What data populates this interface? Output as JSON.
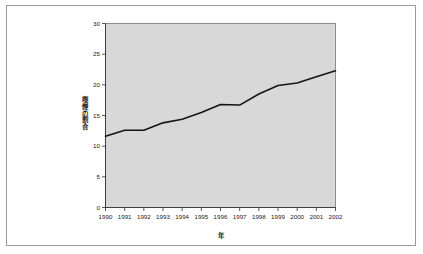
{
  "figure": {
    "frame_border_color": "#9a9a9a",
    "background_color": "#ffffff",
    "plot_background_color": "#d8d8d8",
    "plot_border_color": "#8c8c8c",
    "line_color": "#151515"
  },
  "chart_data": {
    "type": "line",
    "title": "",
    "subtitle": "",
    "xlabel": "年",
    "ylabel": "喫煙の割合",
    "xlim": [
      1990,
      2002
    ],
    "ylim": [
      0,
      30
    ],
    "grid": false,
    "legend": "none",
    "x": [
      1990,
      1991,
      1992,
      1993,
      1994,
      1995,
      1996,
      1997,
      1998,
      1999,
      2000,
      2001,
      2002
    ],
    "categories": [
      "1990",
      "1991",
      "1992",
      "1993",
      "1994",
      "1995",
      "1996",
      "1997",
      "1998",
      "1999",
      "2000",
      "2001",
      "2002"
    ],
    "values": [
      11.6,
      12.6,
      12.6,
      13.8,
      14.4,
      15.5,
      16.8,
      16.7,
      18.5,
      19.9,
      20.3,
      21.3,
      22.3
    ],
    "series": [
      {
        "name": "喫煙の割合",
        "values": [
          11.6,
          12.6,
          12.6,
          13.8,
          14.4,
          15.5,
          16.8,
          16.7,
          18.5,
          19.9,
          20.3,
          21.3,
          22.3
        ]
      }
    ],
    "xticks": [
      "1990",
      "1991",
      "1992",
      "1993",
      "1994",
      "1995",
      "1996",
      "1997",
      "1998",
      "1999",
      "2000",
      "2001",
      "2002"
    ],
    "yticks": [
      "0",
      "5",
      "10",
      "15",
      "20",
      "25",
      "30"
    ],
    "ytick_values": [
      0,
      5,
      10,
      15,
      20,
      25,
      30
    ]
  }
}
